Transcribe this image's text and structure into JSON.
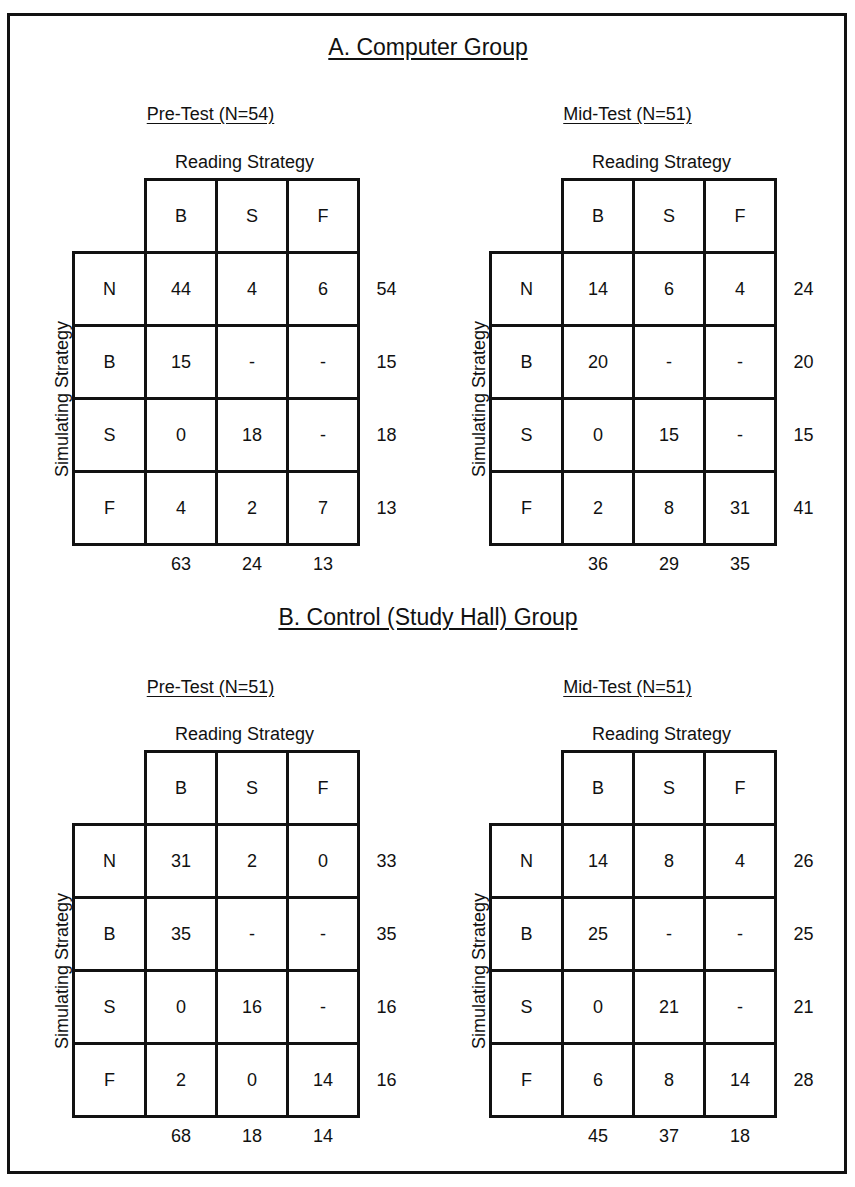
{
  "sections": [
    {
      "title": "A.  Computer Group",
      "tables": [
        {
          "title": "Pre-Test  (N=54)",
          "col_axis_label": "Reading Strategy",
          "row_axis_label": "Simulating Strategy",
          "col_headers": [
            "B",
            "S",
            "F"
          ],
          "row_headers": [
            "N",
            "B",
            "S",
            "F"
          ],
          "cells": [
            [
              "44",
              "4",
              "6"
            ],
            [
              "15",
              "-",
              "-"
            ],
            [
              "0",
              "18",
              "-"
            ],
            [
              "4",
              "2",
              "7"
            ]
          ],
          "row_totals": [
            "54",
            "15",
            "18",
            "13"
          ],
          "col_totals": [
            "63",
            "24",
            "13"
          ]
        },
        {
          "title": "Mid-Test  (N=51)",
          "col_axis_label": "Reading Strategy",
          "row_axis_label": "Simulating Strategy",
          "col_headers": [
            "B",
            "S",
            "F"
          ],
          "row_headers": [
            "N",
            "B",
            "S",
            "F"
          ],
          "cells": [
            [
              "14",
              "6",
              "4"
            ],
            [
              "20",
              "-",
              "-"
            ],
            [
              "0",
              "15",
              "-"
            ],
            [
              "2",
              "8",
              "31"
            ]
          ],
          "row_totals": [
            "24",
            "20",
            "15",
            "41"
          ],
          "col_totals": [
            "36",
            "29",
            "35"
          ]
        }
      ]
    },
    {
      "title": "B.  Control (Study Hall) Group",
      "tables": [
        {
          "title": "Pre-Test  (N=51)",
          "col_axis_label": "Reading Strategy",
          "row_axis_label": "Simulating Strategy",
          "col_headers": [
            "B",
            "S",
            "F"
          ],
          "row_headers": [
            "N",
            "B",
            "S",
            "F"
          ],
          "cells": [
            [
              "31",
              "2",
              "0"
            ],
            [
              "35",
              "-",
              "-"
            ],
            [
              "0",
              "16",
              "-"
            ],
            [
              "2",
              "0",
              "14"
            ]
          ],
          "row_totals": [
            "33",
            "35",
            "16",
            "16"
          ],
          "col_totals": [
            "68",
            "18",
            "14"
          ]
        },
        {
          "title": "Mid-Test  (N=51)",
          "col_axis_label": "Reading Strategy",
          "row_axis_label": "Simulating Strategy",
          "col_headers": [
            "B",
            "S",
            "F"
          ],
          "row_headers": [
            "N",
            "B",
            "S",
            "F"
          ],
          "cells": [
            [
              "14",
              "8",
              "4"
            ],
            [
              "25",
              "-",
              "-"
            ],
            [
              "0",
              "21",
              "-"
            ],
            [
              "6",
              "8",
              "14"
            ]
          ],
          "row_totals": [
            "26",
            "25",
            "21",
            "28"
          ],
          "col_totals": [
            "45",
            "37",
            "18"
          ]
        }
      ]
    }
  ]
}
